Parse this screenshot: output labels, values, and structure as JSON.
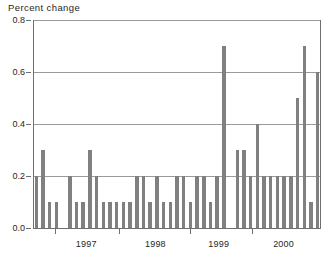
{
  "chart_data": {
    "type": "bar",
    "title": "Percent change",
    "xlabel": "",
    "ylabel": "",
    "ylim": [
      0.0,
      0.8
    ],
    "ytick_labels": [
      "0.0",
      "0.2",
      "0.4",
      "0.6",
      "0.8"
    ],
    "ytick_values": [
      0.0,
      0.2,
      0.4,
      0.6,
      0.8
    ],
    "grid": true,
    "legend": "none",
    "bar_color": "#808080",
    "axis_color": "#6f6f6f",
    "gridline_color": "#9a9a9a",
    "xtick_labels": [
      "1997",
      "1998",
      "1999",
      "2000"
    ],
    "xtick_positions": [
      0.185,
      0.425,
      0.645,
      0.87
    ],
    "x_boundary_ticks": [
      0.075,
      0.3,
      0.545,
      0.76
    ],
    "categories": [
      "1996-10",
      "1996-11",
      "1996-12",
      "1997-01",
      "1997-02",
      "1997-03",
      "1997-04",
      "1997-05",
      "1997-06",
      "1997-07",
      "1997-08",
      "1997-09",
      "1997-10",
      "1997-11",
      "1997-12",
      "1998-01",
      "1998-02",
      "1998-03",
      "1998-04",
      "1998-05",
      "1998-06",
      "1998-07",
      "1998-08",
      "1998-09",
      "1998-10",
      "1998-11",
      "1998-12",
      "1999-01",
      "1999-02",
      "1999-03",
      "1999-04",
      "1999-05",
      "1999-06",
      "1999-07",
      "1999-08",
      "1999-09",
      "1999-10",
      "1999-11",
      "1999-12",
      "2000-01",
      "2000-02",
      "2000-03",
      "2000-04"
    ],
    "values": [
      0.2,
      0.3,
      0.1,
      0.1,
      0.0,
      0.2,
      0.1,
      0.1,
      0.3,
      0.2,
      0.1,
      0.1,
      0.1,
      0.1,
      0.1,
      0.2,
      0.2,
      0.1,
      0.2,
      0.1,
      0.1,
      0.2,
      0.2,
      0.1,
      0.2,
      0.2,
      0.1,
      0.2,
      0.7,
      0.0,
      0.3,
      0.3,
      0.2,
      0.4,
      0.2,
      0.2,
      0.2,
      0.2,
      0.2,
      0.5,
      0.7,
      0.1,
      0.6
    ]
  }
}
